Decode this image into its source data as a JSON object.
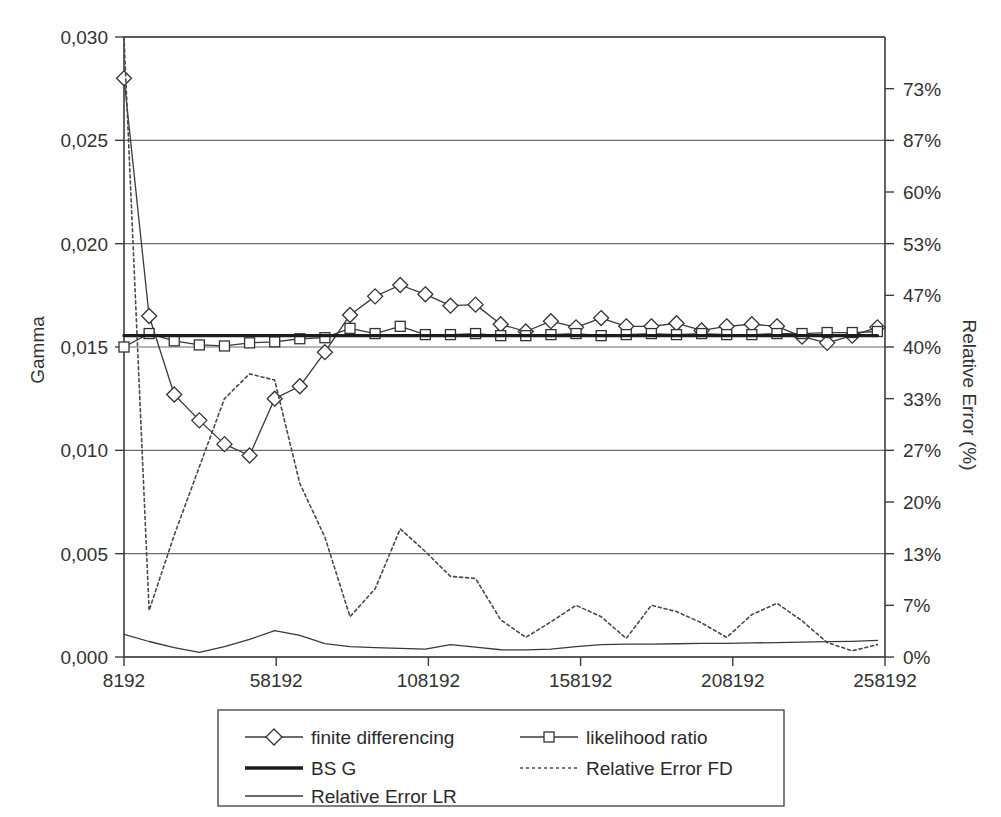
{
  "chart_data": {
    "type": "line",
    "title": "",
    "xlabel": "",
    "ylabel": "Gamma",
    "y2label": "Relative Error (%)",
    "grid": true,
    "legend_position": "bottom",
    "xlim": [
      8192,
      258192
    ],
    "ylim": [
      0.0,
      0.03
    ],
    "y2lim": [
      0,
      80
    ],
    "xticks": [
      "8192",
      "58192",
      "108192",
      "158192",
      "208192",
      "258192"
    ],
    "xtick_values": [
      8192,
      58192,
      108192,
      158192,
      208192,
      258192
    ],
    "yticks": [
      "0,000",
      "0,005",
      "0,010",
      "0,015",
      "0,020",
      "0,025",
      "0,030"
    ],
    "ytick_values": [
      0.0,
      0.005,
      0.01,
      0.015,
      0.02,
      0.025,
      0.03
    ],
    "y2ticks": [
      "0%",
      "7%",
      "13%",
      "20%",
      "27%",
      "33%",
      "40%",
      "47%",
      "53%",
      "60%",
      "87%",
      "73%"
    ],
    "y2tick_values": [
      0,
      0.0025,
      0.005,
      0.0075,
      0.01,
      0.0125,
      0.015,
      0.0175,
      0.02,
      0.0225,
      0.025,
      0.0275
    ],
    "x": [
      8192,
      16442,
      24692,
      32942,
      41192,
      49442,
      57692,
      65942,
      74192,
      82442,
      90692,
      98942,
      107192,
      115442,
      123692,
      131942,
      140192,
      148442,
      156692,
      164942,
      173192,
      181442,
      189692,
      197942,
      206192,
      214442,
      222692,
      230942,
      239192,
      247442,
      255692
    ],
    "series": [
      {
        "name": "finite differencing",
        "marker": "diamond",
        "style": "solid-thin",
        "values": [
          0.028,
          0.0165,
          0.0127,
          0.01145,
          0.0103,
          0.00975,
          0.0125,
          0.0131,
          0.01475,
          0.01655,
          0.01745,
          0.018,
          0.01755,
          0.017,
          0.01705,
          0.0161,
          0.01575,
          0.01625,
          0.01595,
          0.0164,
          0.016,
          0.016,
          0.01615,
          0.0158,
          0.016,
          0.0161,
          0.016,
          0.0155,
          0.0152,
          0.01555,
          0.01595
        ]
      },
      {
        "name": "likelihood ratio",
        "marker": "square",
        "style": "solid-thin",
        "values": [
          0.015,
          0.01565,
          0.0153,
          0.0151,
          0.01505,
          0.0152,
          0.01525,
          0.0154,
          0.01545,
          0.0159,
          0.01565,
          0.016,
          0.0156,
          0.0156,
          0.01565,
          0.01555,
          0.01555,
          0.0156,
          0.01565,
          0.01555,
          0.0156,
          0.01565,
          0.0156,
          0.01565,
          0.0156,
          0.0156,
          0.01565,
          0.01565,
          0.0157,
          0.0157,
          0.01575
        ]
      },
      {
        "name": "BS G",
        "marker": "none",
        "style": "solid-thick",
        "values": [
          0.01555,
          0.01555,
          0.01555,
          0.01555,
          0.01555,
          0.01555,
          0.01555,
          0.01555,
          0.01555,
          0.01555,
          0.01555,
          0.01555,
          0.01555,
          0.01555,
          0.01555,
          0.01555,
          0.01555,
          0.01555,
          0.01555,
          0.01555,
          0.01555,
          0.01555,
          0.01555,
          0.01555,
          0.01555,
          0.01555,
          0.01555,
          0.01555,
          0.01555,
          0.01555,
          0.01555
        ]
      },
      {
        "name": "Relative Error FD",
        "marker": "none",
        "style": "dotted",
        "values": [
          0.03,
          0.00225,
          0.0059,
          0.0092,
          0.0125,
          0.0137,
          0.0134,
          0.0084,
          0.0058,
          0.00195,
          0.0033,
          0.0062,
          0.0051,
          0.0039,
          0.0038,
          0.0018,
          0.00095,
          0.0017,
          0.0025,
          0.00195,
          0.0009,
          0.0025,
          0.0022,
          0.00165,
          0.00095,
          0.00205,
          0.0026,
          0.00175,
          0.0007,
          0.0003,
          0.0006
        ]
      },
      {
        "name": "Relative Error LR",
        "marker": "none",
        "style": "solid-fine",
        "values": [
          0.0011,
          0.00075,
          0.00045,
          0.00022,
          0.0005,
          0.00085,
          0.00128,
          0.00105,
          0.00065,
          0.0005,
          0.00045,
          0.00042,
          0.00038,
          0.0006,
          0.00048,
          0.00035,
          0.00034,
          0.00038,
          0.0005,
          0.0006,
          0.00062,
          0.00062,
          0.00064,
          0.00066,
          0.00066,
          0.00068,
          0.0007,
          0.00072,
          0.00074,
          0.00076,
          0.0008
        ]
      }
    ]
  },
  "legend": {
    "entries": [
      {
        "label": "finite differencing",
        "style": "diamond",
        "color": "#3a3a3a"
      },
      {
        "label": "likelihood ratio",
        "style": "square",
        "color": "#3a3a3a"
      },
      {
        "label": "BS G",
        "style": "thick",
        "color": "#1c1c1c"
      },
      {
        "label": "Relative Error FD",
        "style": "dotted",
        "color": "#4a4a4a"
      },
      {
        "label": "Relative Error LR",
        "style": "thin",
        "color": "#3a3a3a"
      }
    ]
  },
  "colors": {
    "axis": "#3c3c3c",
    "grid": "#6b6b6b",
    "text": "#2b2b2b",
    "background": "#ffffff"
  }
}
